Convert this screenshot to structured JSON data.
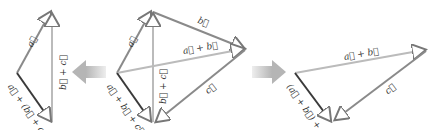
{
  "diagram": {
    "colors": {
      "a_vector": "#8a8a8a",
      "b_vector": "#8a8a8a",
      "c_vector": "#8a8a8a",
      "sum_light": "#b9b9b9",
      "result_dark": "#3a3a3a",
      "arrow_fill": "#c8c8c8"
    },
    "left_panel": {
      "labels": {
        "a": "a⃗",
        "b_plus_c": "b⃗ + c⃗",
        "result": "a⃗ + (b⃗ + c⃗)"
      }
    },
    "center_panel": {
      "labels": {
        "a": "a⃗",
        "b": "b⃗",
        "c": "c⃗",
        "a_plus_b": "a⃗ + b⃗",
        "b_plus_c": "b⃗ + c⃗",
        "result": "a⃗ + b⃗ + c⃗"
      }
    },
    "right_panel": {
      "labels": {
        "a_plus_b": "a⃗ + b⃗",
        "c": "c⃗",
        "result": "(a⃗ + b⃗) + c⃗"
      }
    },
    "arrows": {
      "left_arrow": "arrow-left",
      "right_arrow": "arrow-right"
    }
  }
}
